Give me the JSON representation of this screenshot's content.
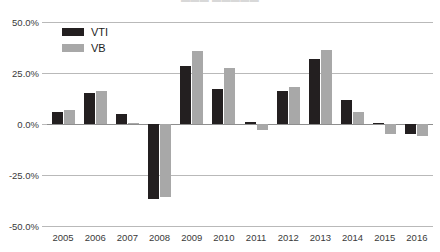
{
  "chart_data": {
    "type": "bar",
    "title": "",
    "xlabel": "",
    "ylabel": "",
    "ylim": [
      -50,
      50
    ],
    "ytick_values": [
      50,
      25,
      0,
      -25,
      -50
    ],
    "ytick_labels": [
      "50.0%",
      "25.0%",
      "0.0%",
      "-25.0%",
      "-50.0%"
    ],
    "grid": true,
    "legend_position": "top-left",
    "categories": [
      "2005",
      "2006",
      "2007",
      "2008",
      "2009",
      "2010",
      "2011",
      "2012",
      "2013",
      "2014",
      "2015",
      "2016"
    ],
    "series": [
      {
        "name": "VTI",
        "color": "#231f20",
        "values": [
          6.0,
          15.0,
          5.0,
          -37.0,
          28.5,
          17.0,
          1.0,
          16.0,
          32.0,
          12.0,
          0.3,
          -5.0
        ]
      },
      {
        "name": "VB",
        "color": "#a8a8a8",
        "values": [
          7.0,
          16.0,
          0.5,
          -36.0,
          36.0,
          27.5,
          -3.0,
          18.0,
          36.5,
          6.0,
          -5.0,
          -6.0
        ]
      }
    ]
  },
  "legend": {
    "items": [
      {
        "label": "VTI",
        "swatch": "vti"
      },
      {
        "label": "VB",
        "swatch": "vb"
      }
    ]
  },
  "title_fragment": {
    "text": "▬▬▬ ▬▬▬▬▬"
  }
}
